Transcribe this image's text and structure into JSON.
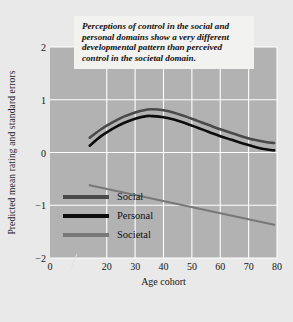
{
  "annotation": {
    "text": "Perceptions of control in the social and personal domains show a very different developmental pattern than perceived control in the societal domain."
  },
  "axis_break_icon": "axis-break-slashes",
  "chart_data": {
    "type": "line",
    "title": "",
    "xlabel": "Age cohort",
    "ylabel": "Predicted mean rating and standard errors",
    "xlim": [
      0,
      80
    ],
    "ylim": [
      -2,
      2
    ],
    "xticks": [
      0,
      20,
      30,
      40,
      50,
      60,
      70,
      80
    ],
    "xticklabels": [
      "0",
      "20",
      "30",
      "40",
      "50",
      "60",
      "70",
      "80"
    ],
    "yticks": [
      2,
      1,
      0,
      -1,
      -2
    ],
    "yticklabels": [
      "2",
      "1",
      "0",
      "−1",
      "−2"
    ],
    "grid": true,
    "grid_color": "#ffffff",
    "plot_background": "#b2b2b2",
    "figure_background": "#e9e9e9",
    "legend_position": "lower left",
    "x_axis_break_at": 10,
    "series": [
      {
        "name": "Social",
        "color": "#4a4a4a",
        "x": [
          14,
          18,
          22,
          26,
          30,
          34,
          36,
          40,
          44,
          48,
          52,
          56,
          60,
          64,
          68,
          72,
          76,
          79
        ],
        "values": [
          0.28,
          0.44,
          0.57,
          0.68,
          0.76,
          0.81,
          0.82,
          0.8,
          0.75,
          0.68,
          0.6,
          0.52,
          0.44,
          0.37,
          0.3,
          0.24,
          0.2,
          0.18
        ]
      },
      {
        "name": "Personal",
        "color": "#0d0d0d",
        "x": [
          14,
          18,
          22,
          26,
          30,
          34,
          36,
          40,
          44,
          48,
          52,
          56,
          60,
          64,
          68,
          72,
          76,
          79
        ],
        "values": [
          0.13,
          0.31,
          0.45,
          0.56,
          0.64,
          0.69,
          0.69,
          0.67,
          0.62,
          0.55,
          0.47,
          0.39,
          0.31,
          0.24,
          0.17,
          0.11,
          0.06,
          0.04
        ]
      },
      {
        "name": "Societal",
        "color": "#787878",
        "x": [
          14,
          79
        ],
        "values": [
          -0.62,
          -1.37
        ]
      }
    ],
    "legend": [
      {
        "label": "Social",
        "color": "#4a4a4a"
      },
      {
        "label": "Personal",
        "color": "#0d0d0d"
      },
      {
        "label": "Societal",
        "color": "#787878"
      }
    ]
  }
}
